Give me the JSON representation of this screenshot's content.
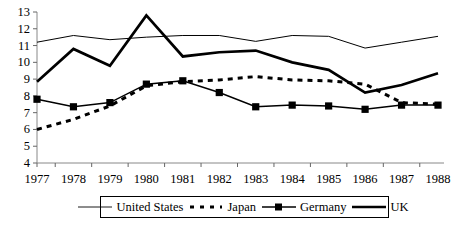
{
  "chart_data": {
    "type": "line",
    "title": "",
    "xlabel": "",
    "ylabel": "",
    "x": [
      1977,
      1978,
      1979,
      1980,
      1981,
      1982,
      1983,
      1984,
      1985,
      1986,
      1987,
      1988
    ],
    "x_tick_labels": [
      "1977",
      "1978",
      "1979",
      "1980",
      "1981",
      "1982",
      "1983",
      "1984",
      "1985",
      "1986",
      "1987",
      "1988"
    ],
    "y_tick_labels": [
      "4",
      "5",
      "6",
      "7",
      "8",
      "9",
      "10",
      "11",
      "12",
      "13"
    ],
    "y_ticks": [
      4,
      5,
      6,
      7,
      8,
      9,
      10,
      11,
      12,
      13
    ],
    "ylim": [
      4,
      13
    ],
    "xlim": [
      1977,
      1988
    ],
    "grid": false,
    "legend_position": "bottom",
    "series": [
      {
        "name": "United States",
        "style": "thin-solid",
        "marker": "none",
        "color": "#000000",
        "values": [
          11.2,
          11.6,
          11.35,
          11.5,
          11.6,
          11.6,
          11.25,
          11.6,
          11.55,
          10.85,
          11.2,
          11.55
        ]
      },
      {
        "name": "Japan",
        "style": "dashed",
        "marker": "none",
        "color": "#000000",
        "values": [
          6.0,
          6.6,
          7.4,
          8.6,
          8.85,
          8.95,
          9.15,
          8.95,
          8.9,
          8.7,
          7.6,
          7.5
        ]
      },
      {
        "name": "Germany",
        "style": "solid-square",
        "marker": "square",
        "color": "#000000",
        "values": [
          7.8,
          7.35,
          7.6,
          8.7,
          8.9,
          8.2,
          7.35,
          7.45,
          7.4,
          7.2,
          7.45,
          7.45
        ]
      },
      {
        "name": "UK",
        "style": "thick-solid",
        "marker": "none",
        "color": "#000000",
        "values": [
          8.85,
          10.8,
          9.8,
          12.8,
          10.35,
          10.6,
          10.7,
          10.0,
          9.55,
          8.2,
          8.65,
          9.35
        ]
      }
    ]
  },
  "legend": {
    "items": [
      {
        "label": "United States",
        "swatch": "thin-line-swatch"
      },
      {
        "label": "Japan",
        "swatch": "dashed-line-swatch"
      },
      {
        "label": "Germany",
        "swatch": "square-marker-line-swatch"
      },
      {
        "label": "UK",
        "swatch": "thick-line-swatch"
      }
    ]
  },
  "axes": {
    "y_axis_name": "y-axis",
    "x_axis_name": "x-axis"
  }
}
